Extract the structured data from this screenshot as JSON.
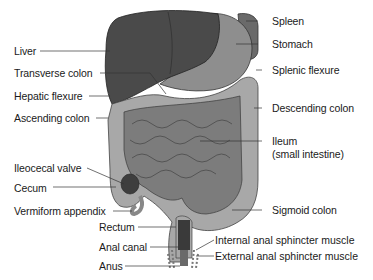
{
  "labels": {
    "liver": "Liver",
    "transverse_colon": "Transverse colon",
    "hepatic_flexure": "Hepatic flexure",
    "ascending_colon": "Ascending colon",
    "ileocecal_valve": "Ileocecal valve",
    "cecum": "Cecum",
    "vermiform_appendix": "Vermiform appendix",
    "rectum": "Rectum",
    "anal_canal": "Anal canal",
    "anus": "Anus",
    "spleen": "Spleen",
    "stomach": "Stomach",
    "splenic_flexure": "Splenic flexure",
    "descending_colon": "Descending colon",
    "ileum_line1": "Ileum",
    "ileum_line2": "(small intestine)",
    "sigmoid_colon": "Sigmoid colon",
    "internal_sphincter": "Internal anal sphincter muscle",
    "external_sphincter": "External anal sphincter muscle"
  },
  "colors": {
    "liver": "#4a4a4a",
    "stomach": "#8e8e8e",
    "spleen": "#6a6a6a",
    "colon": "#a8a8a8",
    "small_intestine": "#7c7c7c",
    "rectum_inner": "#3a3a3a",
    "leader_line": "#333333"
  }
}
